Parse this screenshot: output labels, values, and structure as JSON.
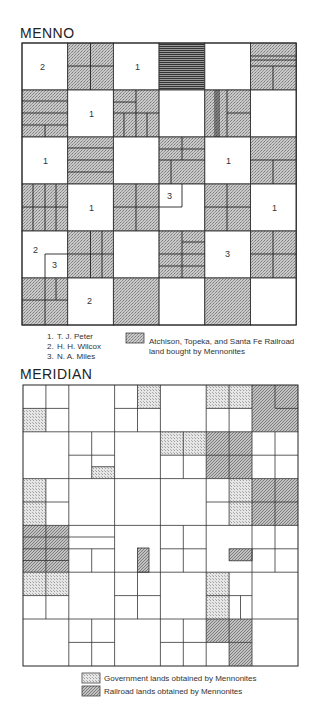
{
  "menno": {
    "title": "MENNO",
    "owners_legend": [
      {
        "num": "1.",
        "name": "T. J. Peter"
      },
      {
        "num": "2.",
        "name": "H. H. Wilcox"
      },
      {
        "num": "3.",
        "name": "N. A. Miles"
      }
    ],
    "railroad_legend": {
      "line1": "Atchison, Topeka, and Santa Fe Railroad",
      "line2": "land bought by Mennonites"
    },
    "section_labels": [
      {
        "text": "2",
        "row": 0,
        "col": 0
      },
      {
        "text": "1",
        "row": 0,
        "col": 2
      },
      {
        "text": "1",
        "row": 1,
        "col": 1
      },
      {
        "text": "1",
        "row": 2,
        "col": 0
      },
      {
        "text": "1",
        "row": 2,
        "col": 4
      },
      {
        "text": "1",
        "row": 3,
        "col": 1
      },
      {
        "text": "3",
        "row": 3,
        "col": 3
      },
      {
        "text": "1",
        "row": 3,
        "col": 5
      },
      {
        "text": "2",
        "row": 4,
        "col": 0
      },
      {
        "text": "3",
        "row": 4,
        "col": 0
      },
      {
        "text": "3",
        "row": 4,
        "col": 4
      },
      {
        "text": "2",
        "row": 5,
        "col": 1
      }
    ]
  },
  "meridian": {
    "title": "MERIDIAN",
    "legend": [
      {
        "label": "Government lands obtained by Mennonites",
        "type": "government"
      },
      {
        "label": "Railroad lands obtained by Mennonites",
        "type": "railroad"
      }
    ]
  },
  "colors": {
    "line": "#333333",
    "stipple": "#b8b8b8",
    "government": "#d6d6d6",
    "railroad": "#a8a8a8",
    "background": "#ffffff"
  }
}
